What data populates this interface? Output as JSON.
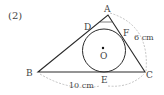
{
  "problem_number": "(2)",
  "points": {
    "A": "A",
    "B": "B",
    "C": "C",
    "D": "D",
    "E": "E",
    "F": "F",
    "O": "O"
  },
  "measurements": {
    "AC": "6 cm",
    "BC": "10 cm"
  },
  "colors": {
    "line": "#2a2a2a",
    "dashed": "#aaaaaa",
    "text": "#444444"
  }
}
